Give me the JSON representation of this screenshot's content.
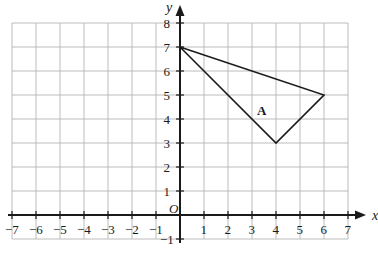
{
  "chart_data": {
    "type": "scatter",
    "title": "",
    "xlabel": "x",
    "ylabel": "y",
    "xlim": [
      -7,
      7
    ],
    "ylim": [
      -1,
      8
    ],
    "grid": true,
    "grid_step": 1,
    "legend": "none",
    "x_ticks": [
      "-7",
      "-6",
      "-5",
      "-4",
      "-3",
      "-2",
      "-1",
      "1",
      "2",
      "3",
      "4",
      "5",
      "6",
      "7"
    ],
    "x_tick_values": [
      -7,
      -6,
      -5,
      -4,
      -3,
      -2,
      -1,
      1,
      2,
      3,
      4,
      5,
      6,
      7
    ],
    "y_ticks": [
      "8",
      "7",
      "6",
      "5",
      "4",
      "3",
      "2",
      "1",
      "-1"
    ],
    "y_tick_values": [
      8,
      7,
      6,
      5,
      4,
      3,
      2,
      1,
      -1
    ],
    "origin_label": "O",
    "shapes": [
      {
        "name": "A",
        "label": "A",
        "type": "triangle",
        "vertices": [
          [
            0,
            7
          ],
          [
            6,
            5
          ],
          [
            4,
            3
          ]
        ],
        "label_position": [
          3.4,
          4.35
        ],
        "stroke": "#1a1a1a",
        "fill": "none"
      }
    ],
    "colors": {
      "grid": "#bcbcbc",
      "axis": "#1a1a1a",
      "shape_stroke": "#1a1a1a",
      "background": "#ffffff",
      "text": "#1a1a1a"
    }
  },
  "axes": {
    "x_axis_name": "x",
    "y_axis_name": "y"
  }
}
